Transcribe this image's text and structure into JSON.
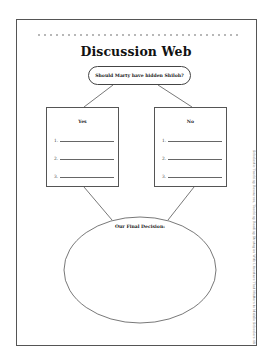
{
  "worksheet": {
    "title": "Discussion Web",
    "question": "Should Marty have hidden Shiloh?",
    "yes_box": {
      "heading": "Yes",
      "items": [
        {
          "number": "1."
        },
        {
          "number": "2."
        },
        {
          "number": "3."
        }
      ]
    },
    "no_box": {
      "heading": "No",
      "items": [
        {
          "number": "1."
        },
        {
          "number": "2."
        },
        {
          "number": "3."
        }
      ]
    },
    "decision_label": "Our Final Decision:",
    "side_credit": "Scholastic Teaching Resources, Teaching Reading Strategies With Literature That Matters to Middle Schoolers  48"
  }
}
